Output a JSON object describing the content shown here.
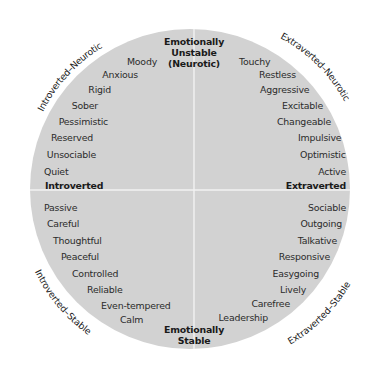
{
  "diagram": {
    "colors": {
      "background": "#ffffff",
      "circle_fill": "#d2d2d2",
      "axis_line": "#f2f2f2",
      "trait_text": "#2b2b2b",
      "label_text": "#1a1a1a"
    },
    "axes": {
      "top": [
        "Emotionally",
        "Unstable",
        "(Neurotic)"
      ],
      "bottom": [
        "Emotionally",
        "Stable"
      ],
      "left": "Introverted",
      "right": "Extraverted"
    },
    "quadrant_labels": {
      "top_left": "Introverted–Neurotic",
      "top_right": "Extraverted–Neurotic",
      "bottom_left": "Introverted–Stable",
      "bottom_right": "Extraverted–Stable"
    },
    "traits": {
      "top_left": [
        "Moody",
        "Anxious",
        "Rigid",
        "Sober",
        "Pessimistic",
        "Reserved",
        "Unsociable",
        "Quiet"
      ],
      "top_right": [
        "Touchy",
        "Restless",
        "Aggressive",
        "Excitable",
        "Changeable",
        "Impulsive",
        "Optimistic",
        "Active"
      ],
      "bottom_left": [
        "Passive",
        "Careful",
        "Thoughtful",
        "Peaceful",
        "Controlled",
        "Reliable",
        "Even-tempered",
        "Calm"
      ],
      "bottom_right": [
        "Sociable",
        "Outgoing",
        "Talkative",
        "Responsive",
        "Easygoing",
        "Lively",
        "Carefree",
        "Leadership"
      ]
    }
  }
}
